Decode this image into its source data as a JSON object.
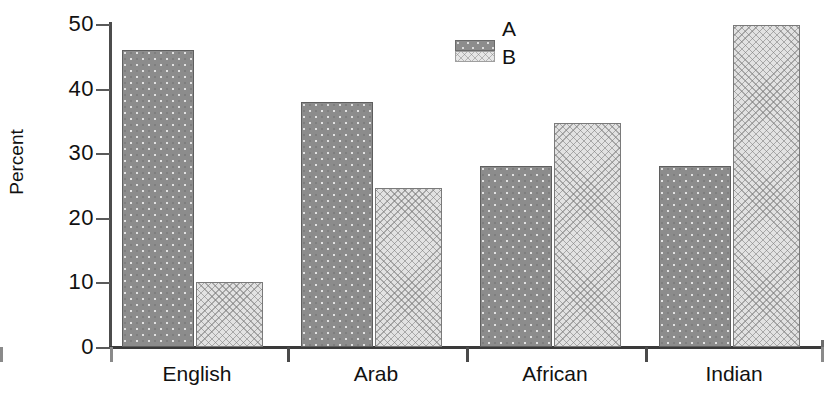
{
  "chart_data": {
    "type": "bar",
    "title": "",
    "xlabel": "",
    "ylabel": "Percent",
    "ylim": [
      0,
      50
    ],
    "yticks": [
      0,
      10,
      20,
      30,
      40,
      50
    ],
    "grid": false,
    "legend_position": "top-center",
    "categories": [
      "English",
      "Arab",
      "African",
      "Indian"
    ],
    "series": [
      {
        "name": "A",
        "color": "#8c8c8c",
        "pattern": "dots",
        "values": [
          46.0,
          37.9,
          28.0,
          28.0
        ]
      },
      {
        "name": "B",
        "color": "#e2e2e2",
        "pattern": "crosshatch",
        "values": [
          10.1,
          24.6,
          34.6,
          49.8
        ]
      }
    ]
  },
  "axes": {
    "y_title": "Percent",
    "y_tick_labels": [
      "50",
      "40",
      "30",
      "20",
      "10",
      "0"
    ],
    "x_tick_labels": [
      "English",
      "Arab",
      "African",
      "Indian"
    ]
  },
  "legend": {
    "entries": [
      {
        "label": "A",
        "swatch": "series-a-swatch"
      },
      {
        "label": "B",
        "swatch": "series-b-swatch"
      }
    ]
  },
  "caption": {
    "text": ""
  }
}
